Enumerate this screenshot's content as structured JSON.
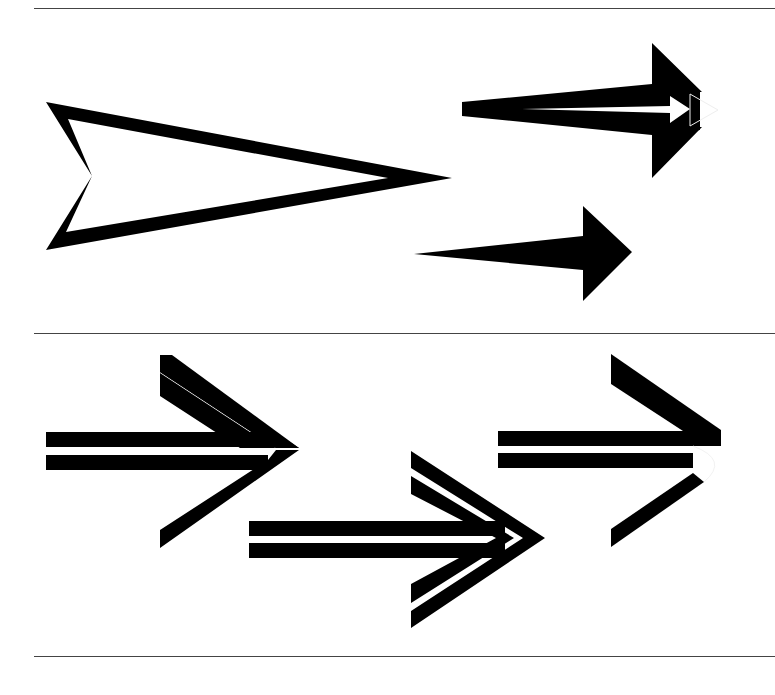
{
  "page": {
    "caption": "",
    "background": "#ffffff",
    "ink": "#000000",
    "rule_color": "#444444"
  },
  "panels": [
    {
      "name": "panel-1",
      "arrows": [
        {
          "id": "outline-chevron-arrow",
          "style": "outlined dart / chevron-tailed triangle"
        },
        {
          "id": "layered-triple-arrow",
          "style": "stacked arrowheads with white inner arrow"
        },
        {
          "id": "tapered-solid-arrow",
          "style": "solid tapered shaft with triangle head"
        }
      ]
    },
    {
      "name": "panel-2",
      "arrows": [
        {
          "id": "double-line-open-arrow",
          "style": "double shaft with open chevron head"
        },
        {
          "id": "double-line-double-chevron-arrow",
          "style": "double shaft with nested double chevron head"
        },
        {
          "id": "double-line-broken-arrow",
          "style": "double shaft with broken open chevron head"
        }
      ]
    }
  ]
}
